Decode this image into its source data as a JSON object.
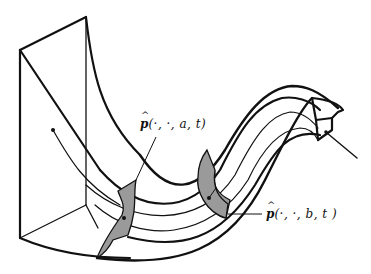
{
  "figure": {
    "colors": {
      "stroke": "#111111",
      "section_fill": "#9a9a9a",
      "background": "#ffffff"
    },
    "labels": {
      "section_a": {
        "symbol": "p",
        "args": "(·, ·, a, t)"
      },
      "section_b": {
        "symbol": "p",
        "args": "(·, ·, b, t )"
      }
    }
  }
}
